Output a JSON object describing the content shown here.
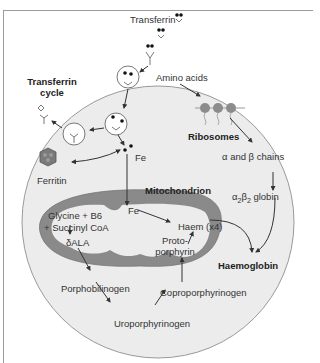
{
  "labels": {
    "transferrin": "Transferrin",
    "transferrin_cycle_line1": "Transferrin",
    "transferrin_cycle_line2": "cycle",
    "amino_acids": "Amino acids",
    "ribosomes": "Ribosomes",
    "alpha_beta_chains": "α and β chains",
    "globin_prefix": "α",
    "globin_sub1": "2",
    "globin_mid": "β",
    "globin_sub2": "2",
    "globin_suffix": " globin",
    "ferritin": "Ferritin",
    "fe_cytoplasm": "Fe",
    "mitochondrion": "Mitochondrion",
    "fe_mito": "Fe",
    "glycine_b6": "Glycine + B6",
    "succinyl_coa": "+ Succinyl CoA",
    "delta_ala": "δALA",
    "haem": "Haem (x4)",
    "protoporphyrin_line1": "Proto-",
    "protoporphyrin_line2": "porphyrin",
    "haemoglobin": "Haemoglobin",
    "porphobilinogen": "Porphobilinogen",
    "uroporphyrinogen": "Uroporphyrinogen",
    "coproporphyrinogen": "Coproporphyrinogen"
  },
  "colors": {
    "cell_fill": "#ececec",
    "cell_stroke": "#9a9a9a",
    "mito_membrane": "#8a8a8a",
    "ribosome": "#8c8c8c",
    "ferritin": "#7a7a7a",
    "arrow": "#333333",
    "frame": "#9a9a9a"
  }
}
